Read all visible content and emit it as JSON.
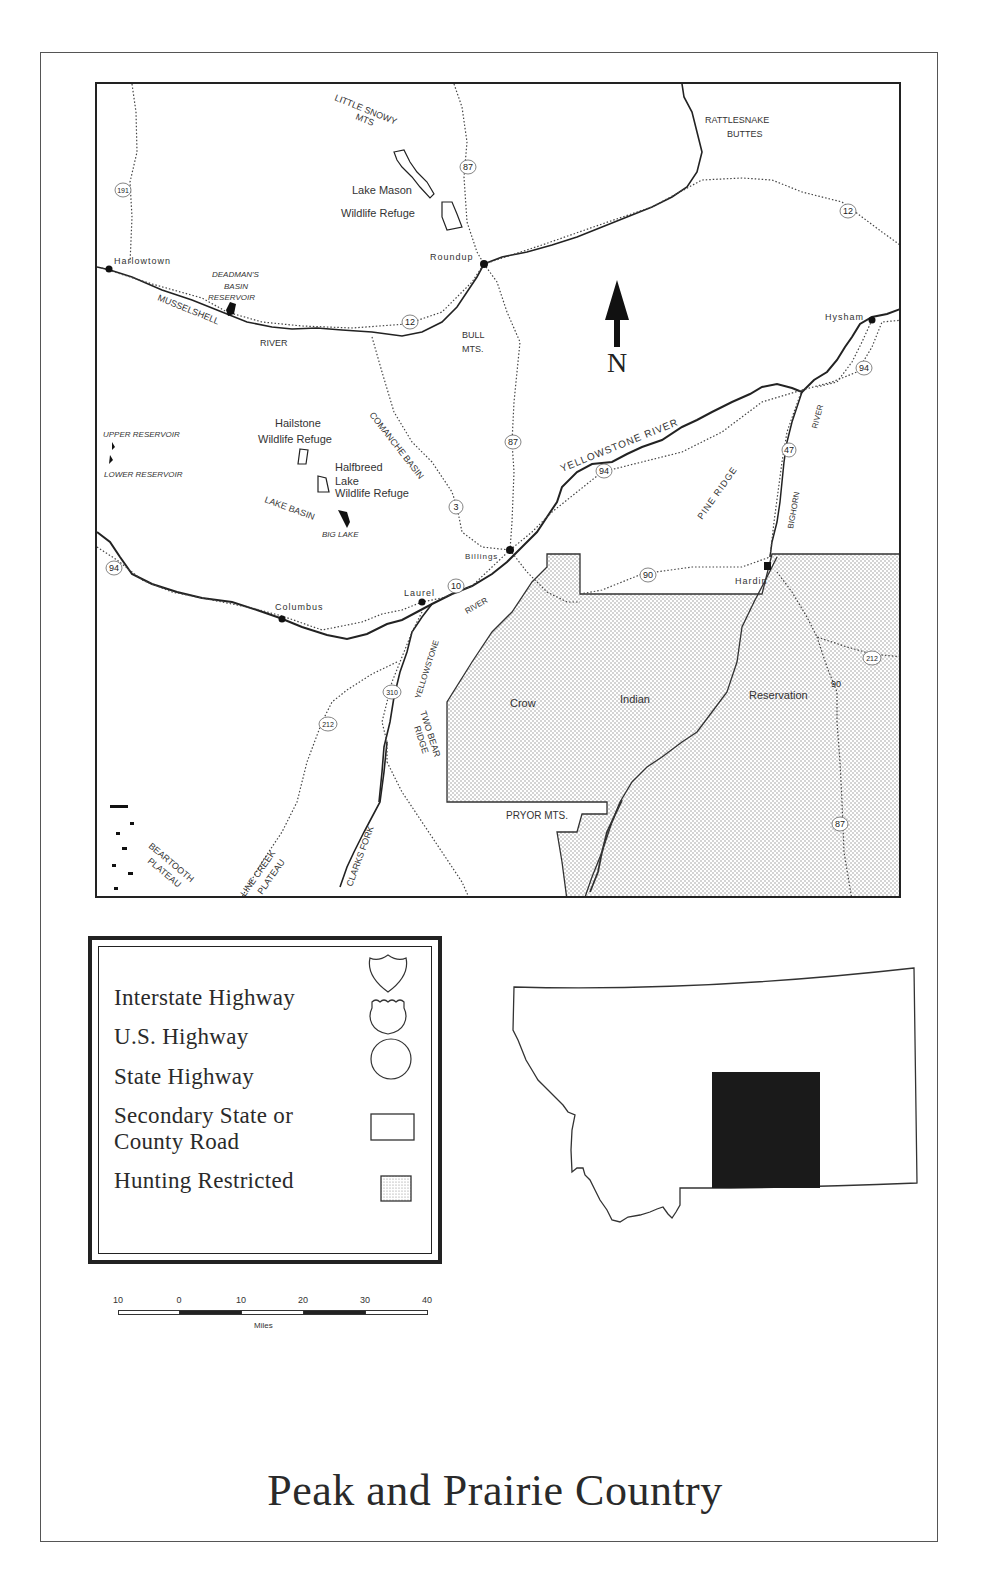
{
  "title": "Peak and Prairie Country",
  "map": {
    "north_arrow": "N",
    "towns": [
      "Harlowtown",
      "Roundup",
      "Hysham",
      "Billings",
      "Laurel",
      "Columbus",
      "Hardin"
    ],
    "features": {
      "little_snowy_mts": [
        "LITTLE SNOWY",
        "MTS"
      ],
      "rattlesnake_buttes": [
        "RATTLESNAKE",
        "BUTTES"
      ],
      "lake_mason": [
        "Lake Mason",
        "Wildlife Refuge"
      ],
      "deadmans_basin": [
        "DEADMAN'S",
        "BASIN",
        "RESERVOIR"
      ],
      "musselshell": "MUSSELSHELL",
      "musselshell_river": "RIVER",
      "bull_mts": [
        "BULL",
        "MTS."
      ],
      "upper_reservoir": "UPPER RESERVOIR",
      "lower_reservoir": "LOWER RESERVOIR",
      "hailstone": [
        "Hailstone",
        "Wildlife Refuge"
      ],
      "halfbreed": [
        "Halfbreed",
        "Lake",
        "Wildlife Refuge"
      ],
      "comanche_basin": "COMANCHE BASIN",
      "lake_basin": "LAKE BASIN",
      "big_lake": "BIG LAKE",
      "yellowstone_river_upper": "YELLOWSTONE RIVER",
      "yellowstone_river_lower_a": "RIVER",
      "yellowstone_river_lower_b": "YELLOWSTONE",
      "pine_ridge": "PINE RIDGE",
      "bighorn_river": "BIGHORN",
      "bighorn_river2": "RIVER",
      "two_bear_ridge": [
        "TWO BEAR",
        "RIDGE"
      ],
      "crow": "Crow",
      "indian": "Indian",
      "reservation": "Reservation",
      "pryor_mts": "PRYOR MTS.",
      "beartooth_plateau": [
        "BEARTOOTH",
        "PLATEAU"
      ],
      "line_creek_plateau": [
        "LINE CREEK",
        "PLATEAU"
      ],
      "clarks_fork": "CLARKS FORK"
    },
    "shields": {
      "us191": "191",
      "us87_n": "87",
      "us12_w": "12",
      "us12_e": "12",
      "us87_c": "87",
      "mt3": "3",
      "i94_w": "94",
      "i94_c": "94",
      "i94_e": "94",
      "mt47": "47",
      "i90_c": "90",
      "us10": "10",
      "us310": "310",
      "us212_w": "212",
      "us212_e": "212",
      "i90_e": "90",
      "us87_s": "87"
    }
  },
  "legend": {
    "items": [
      {
        "label": "Interstate Highway",
        "symbol": "interstate-shield"
      },
      {
        "label": "U.S. Highway",
        "symbol": "us-shield"
      },
      {
        "label": "State Highway",
        "symbol": "state-circle"
      },
      {
        "label_line1": "Secondary State or",
        "label_line2": "County Road",
        "symbol": "rectangle"
      },
      {
        "label": "Hunting Restricted",
        "symbol": "stippled-square"
      }
    ]
  },
  "scale": {
    "ticks": [
      "10",
      "0",
      "10",
      "20",
      "30",
      "40"
    ],
    "unit": "Miles"
  },
  "inset": {
    "state": "Montana",
    "highlight_color": "#1a1a1a"
  },
  "colors": {
    "ink": "#2a2a2a",
    "paper": "#ffffff",
    "stipple": "#999999"
  }
}
